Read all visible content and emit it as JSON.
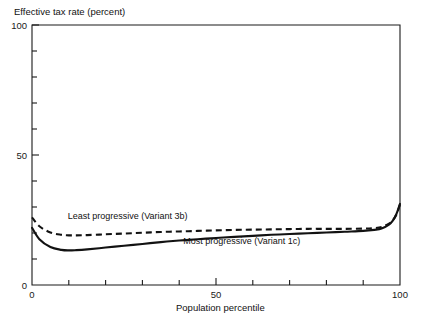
{
  "chart_data": {
    "type": "line",
    "title": "",
    "ylabel": "Effective tax rate (percent)",
    "xlabel": "Population percentile",
    "xlim": [
      0,
      100
    ],
    "ylim": [
      0,
      100
    ],
    "grid": false,
    "legend_position": "inline-annotation",
    "x_ticks": [
      0,
      10,
      20,
      30,
      40,
      50,
      60,
      70,
      80,
      90,
      100
    ],
    "x_tick_labels": [
      "0",
      "",
      "",
      "",
      "",
      "50",
      "",
      "",
      "",
      "",
      "100"
    ],
    "y_ticks": [
      0,
      10,
      20,
      30,
      40,
      50,
      60,
      70,
      80,
      90,
      100
    ],
    "y_tick_labels": [
      "0",
      "",
      "",
      "",
      "",
      "50",
      "",
      "",
      "",
      "",
      "100"
    ],
    "x": [
      0,
      2,
      5,
      8,
      10,
      12,
      15,
      20,
      25,
      30,
      35,
      40,
      45,
      50,
      55,
      60,
      65,
      70,
      75,
      80,
      85,
      90,
      93,
      95,
      97,
      98,
      99,
      100
    ],
    "series": [
      {
        "name": "Least progressive (Variant 3b)",
        "style": "dashed",
        "label_x": 26,
        "label_y": 25.5,
        "values": [
          26.0,
          22.6,
          20.2,
          19.3,
          19.1,
          19.1,
          19.2,
          19.5,
          19.8,
          20.1,
          20.4,
          20.6,
          20.8,
          21.0,
          21.2,
          21.3,
          21.4,
          21.5,
          21.6,
          21.6,
          21.6,
          21.7,
          21.9,
          22.3,
          23.6,
          24.8,
          27.0,
          31.0
        ]
      },
      {
        "name": "Most progressive (Variant 1c)",
        "style": "solid",
        "label_x": 57,
        "label_y": 15.8,
        "values": [
          22.0,
          17.6,
          14.6,
          13.5,
          13.3,
          13.4,
          13.7,
          14.4,
          15.1,
          15.8,
          16.5,
          17.1,
          17.6,
          18.1,
          18.5,
          18.9,
          19.3,
          19.6,
          19.9,
          20.2,
          20.5,
          20.8,
          21.2,
          21.7,
          23.2,
          24.7,
          27.2,
          31.2
        ]
      }
    ]
  }
}
